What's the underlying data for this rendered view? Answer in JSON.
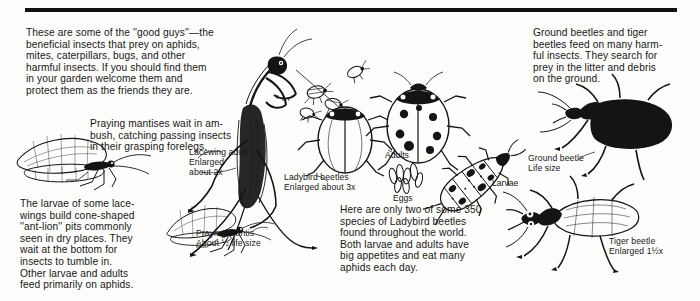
{
  "page": {
    "rule_color": "#111111",
    "background_color": "#fdfdfb",
    "ink_color": "#141414"
  },
  "text_blocks": {
    "intro": "These are some of the ''good guys''—the\nbeneficial insects that prey on aphids,\nmites, caterpillars, bugs, and other\nharmful insects. If you should find them\nin your garden welcome them and\nprotect them as the friends they are.",
    "mantis": "Praying mantises wait in am-\nbush, catching passing insects\nin their grasping forelegs.",
    "lacewing_larvae": "The larvae of some lace-\nwings build cone-shaped\n''ant-lion'' pits commonly\nseen in dry places. They\nwait at the bottom for\ninsects to tumble in.\nOther larvae and adults\nfeed primarily on aphids.",
    "ladybird": "Here are only two of some 350\nspecies of Ladybird beetles\nfound throughout the world.\nBoth larvae and adults have\nbig appetites and eat many\naphids each day.",
    "ground_tiger": "Ground beetles and tiger\nbeetles feed on many harm-\nful insects. They search for\nprey in the litter and debris\non the ground."
  },
  "captions": {
    "lacewing_adult": "Lacewing adult\nEnlarged\nabout 2x",
    "ladybird_beetles": "Ladybird beetles\nEnlarged about 3x",
    "praying_mantis": "Praying mantis\nAbout ½ life size",
    "ground_beetle": "Ground beetle\nLife size",
    "tiger_beetle": "Tiger beetle\nEnlarged 1½x",
    "adults": "Adults",
    "eggs": "Eggs",
    "larvae": "Larvae"
  },
  "figures": {
    "lacewing_adult": "lacewing-adult-illustration",
    "praying_mantis": "praying-mantis-illustration",
    "ladybird_beetle_left": "ladybird-beetle-illustration",
    "ladybird_beetle_right": "ladybird-beetle-spotted-illustration",
    "aphids": "aphid-cluster-illustration",
    "ladybird_eggs": "ladybird-eggs-illustration",
    "ladybird_larva": "ladybird-larva-illustration",
    "ground_beetle": "ground-beetle-illustration",
    "tiger_beetle": "tiger-beetle-illustration",
    "lacewing_lower": "lacewing-lower-illustration"
  }
}
